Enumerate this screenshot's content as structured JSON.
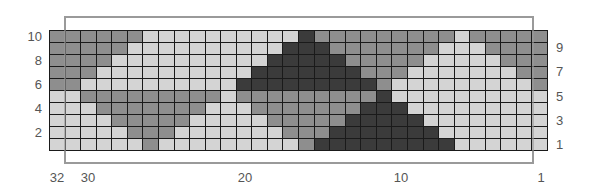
{
  "chart_title": "",
  "colors": {
    "L": "#d4d4d4",
    "G": "#8e8e8e",
    "D": "#3b3b3b",
    "gridline": "#1a1a1a",
    "frame": "#9a9a9a"
  },
  "chart_data": {
    "type": "heatmap",
    "columns": 32,
    "rows": 10,
    "column_labels": [
      "32",
      "30",
      "20",
      "10",
      "1"
    ],
    "row_labels_left": [
      "10",
      "8",
      "6",
      "4",
      "2"
    ],
    "row_labels_right": [
      "9",
      "7",
      "5",
      "3",
      "1"
    ],
    "legend": {
      "L": "light",
      "G": "medium gray",
      "D": "dark"
    },
    "grid_rows_top_to_bottom": [
      {
        "row": 10,
        "cells": "GGGGGGLLLLLLLLLLDGGGGGGGGGLGGGGG"
      },
      {
        "row": 9,
        "cells": "GGGGGLLLLLLLLLLDDDGGGGGGGLLLGGGG"
      },
      {
        "row": 8,
        "cells": "GGGGLLLLLLLLLLDDDDDGGGGGLLLLLGGG"
      },
      {
        "row": 7,
        "cells": "GGGLLLLLLLLLLDDDDDDDGGGLLLLLLLGG"
      },
      {
        "row": 6,
        "cells": "GGLLLLLLLLLLDDDDDDDDDGLLLLLLLLLG"
      },
      {
        "row": 5,
        "cells": "LLGGGGGGGGGLGGGGGGGGGDLLLLLLLLLL"
      },
      {
        "row": 4,
        "cells": "LLLGGGGGGGLLLGGGGGGGDDDLLLLLLLLL"
      },
      {
        "row": 3,
        "cells": "LLLLGGGGGLLLLLGGGGGDDDDDLLLLLLLL"
      },
      {
        "row": 2,
        "cells": "LLLLLGGGLLLLLLLGGGDDDDDDDLLLLLLL"
      },
      {
        "row": 1,
        "cells": "LLLLLLGLLLLLLLLLGDDDDDDDDDLLLLLL"
      }
    ]
  }
}
